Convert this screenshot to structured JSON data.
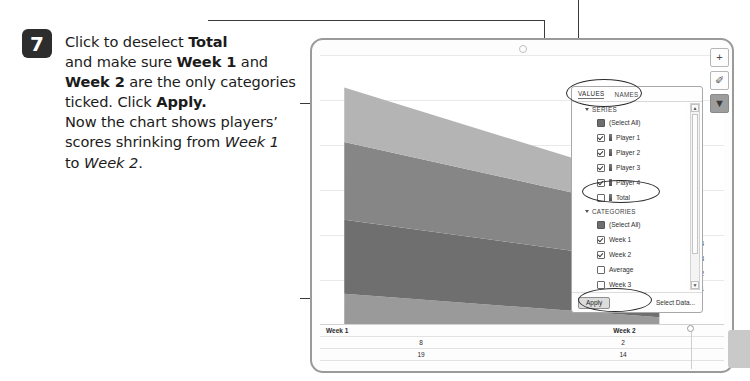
{
  "step": {
    "number": "7",
    "lines": [
      {
        "parts": [
          {
            "t": "Click to deselect ",
            "s": "n"
          },
          {
            "t": "Total",
            "s": "b"
          }
        ]
      },
      {
        "parts": [
          {
            "t": "and make sure ",
            "s": "n"
          },
          {
            "t": "Week 1",
            "s": "b"
          },
          {
            "t": " and",
            "s": "n"
          }
        ]
      },
      {
        "parts": [
          {
            "t": "Week 2",
            "s": "b"
          },
          {
            "t": " are the only categories",
            "s": "n"
          }
        ]
      },
      {
        "parts": [
          {
            "t": "ticked. Click ",
            "s": "n"
          },
          {
            "t": "Apply.",
            "s": "b"
          }
        ]
      },
      {
        "parts": [
          {
            "t": "Now the chart shows players’",
            "s": "n"
          }
        ]
      },
      {
        "parts": [
          {
            "t": "scores shrinking from ",
            "s": "n"
          },
          {
            "t": "Week 1",
            "s": "i"
          }
        ]
      },
      {
        "parts": [
          {
            "t": "to ",
            "s": "n"
          },
          {
            "t": "Week 2",
            "s": "i"
          },
          {
            "t": ".",
            "s": "n"
          }
        ]
      }
    ]
  },
  "chart_window": {
    "tool_buttons": [
      {
        "name": "chart-elements-button",
        "glyph": "+",
        "active": false
      },
      {
        "name": "chart-styles-button",
        "glyph": "✐",
        "active": false
      },
      {
        "name": "chart-filters-button",
        "glyph": "▼",
        "active": true
      }
    ],
    "legend_labels": [
      "yer 4",
      "yer 3",
      "yer 2",
      "yer 1"
    ]
  },
  "chart_data": {
    "type": "area",
    "stacked": true,
    "title": "",
    "xlabel": "",
    "ylabel": "",
    "categories": [
      "Week 1",
      "Week 2"
    ],
    "grid": true,
    "legend_position": "right",
    "series": [
      {
        "name": "Player 1",
        "values": [
          8,
          2
        ],
        "color": "#9a9a9a"
      },
      {
        "name": "Player 2",
        "values": [
          19,
          14
        ],
        "color": "#6f6f6f"
      },
      {
        "name": "Player 3",
        "values": [
          20,
          13
        ],
        "color": "#868686"
      },
      {
        "name": "Player 4",
        "values": [
          14,
          7
        ],
        "color": "#b4b4b4"
      }
    ],
    "table": {
      "columns": [
        "Week 1",
        "Week 2"
      ],
      "rows": [
        [
          "8",
          "2"
        ],
        [
          "19",
          "14"
        ]
      ]
    }
  },
  "filter_panel": {
    "tabs": [
      {
        "label": "VALUES",
        "selected": true
      },
      {
        "label": "NAMES",
        "selected": false
      }
    ],
    "groups": [
      {
        "title": "SERIES",
        "expanded": true,
        "items": [
          {
            "label": "(Select All)",
            "state": "partial",
            "swatch": false
          },
          {
            "label": "Player 1",
            "state": "checked",
            "swatch": true
          },
          {
            "label": "Player 2",
            "state": "checked",
            "swatch": true
          },
          {
            "label": "Player 3",
            "state": "checked",
            "swatch": true
          },
          {
            "label": "Player 4",
            "state": "checked",
            "swatch": true
          },
          {
            "label": "Total",
            "state": "unchecked",
            "swatch": true
          }
        ]
      },
      {
        "title": "CATEGORIES",
        "expanded": true,
        "items": [
          {
            "label": "(Select All)",
            "state": "partial",
            "swatch": false
          },
          {
            "label": "Week 1",
            "state": "checked",
            "swatch": false
          },
          {
            "label": "Week 2",
            "state": "checked",
            "swatch": false
          },
          {
            "label": "Average",
            "state": "unchecked",
            "swatch": false
          },
          {
            "label": "Week 3",
            "state": "unchecked",
            "swatch": false
          }
        ]
      }
    ],
    "apply_label": "Apply",
    "select_data_label": "Select Data..."
  }
}
